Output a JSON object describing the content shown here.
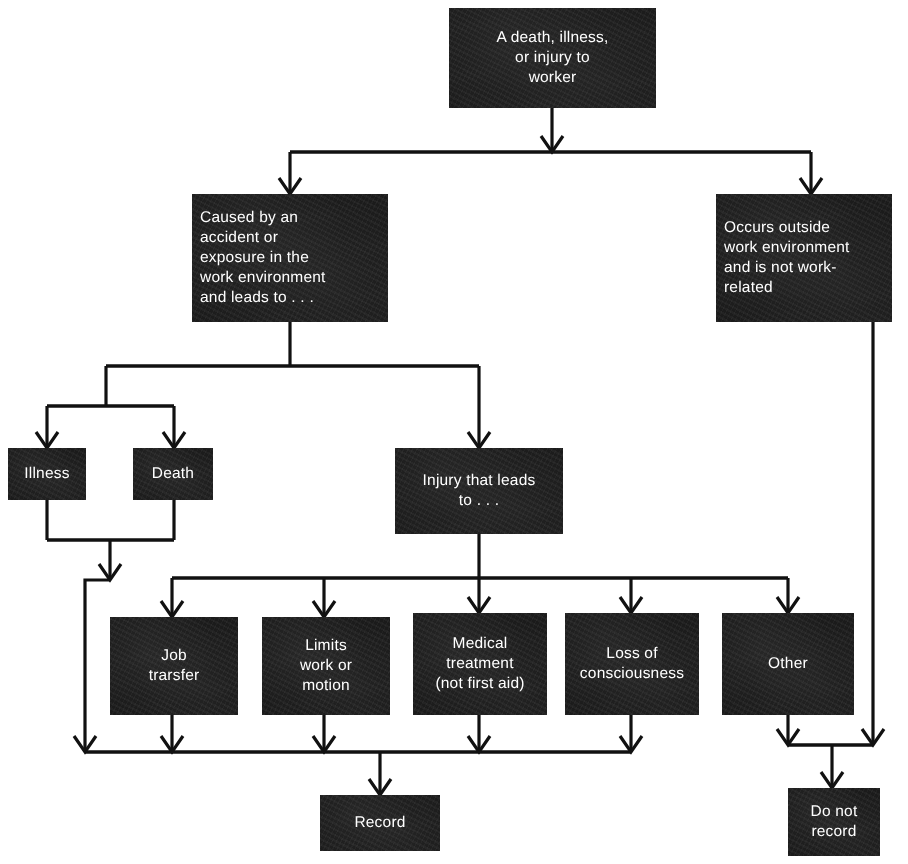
{
  "diagram": {
    "type": "flowchart",
    "colors": {
      "box_fill": "#1b1b1b",
      "box_text": "#ffffff",
      "connector": "#111111",
      "background": "#ffffff"
    },
    "nodes": [
      {
        "id": "start",
        "label": "A death, illness,\nor injury to\nworker",
        "align": "center",
        "x": 449,
        "y": 8,
        "w": 207,
        "h": 100
      },
      {
        "id": "work_related",
        "label": "Caused by an\naccident or\nexposure in the\nwork environment\nand leads to . . .",
        "align": "left",
        "x": 192,
        "y": 194,
        "w": 196,
        "h": 128
      },
      {
        "id": "not_work_related",
        "label": "Occurs outside\nwork environment\nand is not work-\nrelated",
        "align": "left",
        "x": 716,
        "y": 194,
        "w": 176,
        "h": 128
      },
      {
        "id": "illness",
        "label": "Illness",
        "align": "center",
        "x": 8,
        "y": 448,
        "w": 78,
        "h": 52
      },
      {
        "id": "death",
        "label": "Death",
        "align": "center",
        "x": 133,
        "y": 448,
        "w": 80,
        "h": 52
      },
      {
        "id": "injury",
        "label": "Injury that leads\nto . . .",
        "align": "center",
        "x": 395,
        "y": 448,
        "w": 168,
        "h": 86
      },
      {
        "id": "job_transfer",
        "label": "Job\ntrarsfer",
        "align": "center",
        "x": 110,
        "y": 617,
        "w": 128,
        "h": 98
      },
      {
        "id": "limits_work",
        "label": "Limits\nwork or\nmotion",
        "align": "center",
        "x": 262,
        "y": 617,
        "w": 128,
        "h": 98
      },
      {
        "id": "medical_treatment",
        "label": "Medical\ntreatment\n(not first aid)",
        "align": "center",
        "x": 413,
        "y": 613,
        "w": 134,
        "h": 102
      },
      {
        "id": "loss_of_consciousness",
        "label": "Loss of\nconsciousness",
        "align": "center",
        "x": 565,
        "y": 613,
        "w": 134,
        "h": 102
      },
      {
        "id": "other",
        "label": "Other",
        "align": "center",
        "x": 722,
        "y": 613,
        "w": 132,
        "h": 102
      },
      {
        "id": "record",
        "label": "Record",
        "align": "center",
        "x": 320,
        "y": 795,
        "w": 120,
        "h": 56
      },
      {
        "id": "do_not_record",
        "label": "Do not\nrecord",
        "align": "center",
        "x": 788,
        "y": 788,
        "w": 92,
        "h": 68
      }
    ],
    "edges": [
      {
        "from": "start",
        "to": "work_related"
      },
      {
        "from": "start",
        "to": "not_work_related"
      },
      {
        "from": "work_related",
        "to": "illness"
      },
      {
        "from": "work_related",
        "to": "death"
      },
      {
        "from": "work_related",
        "to": "injury"
      },
      {
        "from": "illness",
        "to": "record"
      },
      {
        "from": "death",
        "to": "record"
      },
      {
        "from": "injury",
        "to": "job_transfer"
      },
      {
        "from": "injury",
        "to": "limits_work"
      },
      {
        "from": "injury",
        "to": "medical_treatment"
      },
      {
        "from": "injury",
        "to": "loss_of_consciousness"
      },
      {
        "from": "injury",
        "to": "other"
      },
      {
        "from": "job_transfer",
        "to": "record"
      },
      {
        "from": "limits_work",
        "to": "record"
      },
      {
        "from": "medical_treatment",
        "to": "record"
      },
      {
        "from": "loss_of_consciousness",
        "to": "record"
      },
      {
        "from": "other",
        "to": "do_not_record"
      },
      {
        "from": "not_work_related",
        "to": "do_not_record"
      }
    ]
  }
}
